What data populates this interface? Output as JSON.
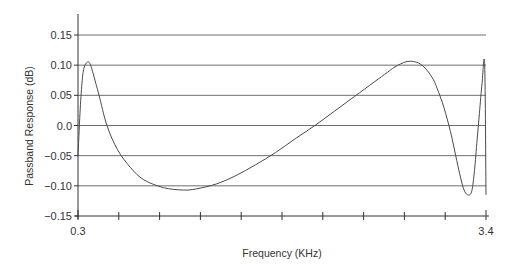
{
  "chart_data": {
    "type": "line",
    "title": "",
    "xlabel": "Frequency (KHz)",
    "ylabel": "Passband Response (dB)",
    "xlim": [
      0.3,
      3.4
    ],
    "ylim": [
      -0.15,
      0.15
    ],
    "x_tick_labels": [
      "0.3",
      "3.4"
    ],
    "x_minor_ticks": 10,
    "y_ticks": [
      0.15,
      0.1,
      0.05,
      0.0,
      -0.05,
      -0.1,
      -0.15
    ],
    "y_tick_labels": [
      "0.15",
      "0.10",
      "0.05",
      "0.0",
      "−0.05",
      "−0.10",
      "−0.15"
    ],
    "grid": "horizontal",
    "legend": "none",
    "series": [
      {
        "name": "Passband Response",
        "x": [
          0.3,
          0.315,
          0.33,
          0.345,
          0.37,
          0.39,
          0.41,
          0.435,
          0.46,
          0.52,
          0.6,
          0.7,
          0.8,
          0.95,
          1.1,
          1.2,
          1.35,
          1.5,
          1.65,
          1.8,
          1.95,
          2.1,
          2.25,
          2.4,
          2.55,
          2.65,
          2.7,
          2.75,
          2.8,
          2.85,
          2.9,
          2.95,
          3.0,
          3.04,
          3.08,
          3.13,
          3.17,
          3.2,
          3.23,
          3.26,
          3.29,
          3.31,
          3.33,
          3.35,
          3.37,
          3.39,
          3.4
        ],
        "y": [
          -0.05,
          0.02,
          0.07,
          0.095,
          0.105,
          0.103,
          0.09,
          0.07,
          0.05,
          0.0,
          -0.04,
          -0.07,
          -0.09,
          -0.103,
          -0.107,
          -0.105,
          -0.097,
          -0.083,
          -0.065,
          -0.045,
          -0.022,
          0.0,
          0.024,
          0.048,
          0.072,
          0.088,
          0.096,
          0.102,
          0.106,
          0.106,
          0.102,
          0.092,
          0.076,
          0.055,
          0.03,
          -0.01,
          -0.05,
          -0.08,
          -0.105,
          -0.115,
          -0.11,
          -0.08,
          -0.03,
          0.02,
          0.07,
          0.1,
          -0.115
        ]
      }
    ]
  },
  "colors": {
    "line": "#4a4a4a",
    "grid": "#6e6e6e",
    "axis": "#333333",
    "text": "#333333"
  }
}
